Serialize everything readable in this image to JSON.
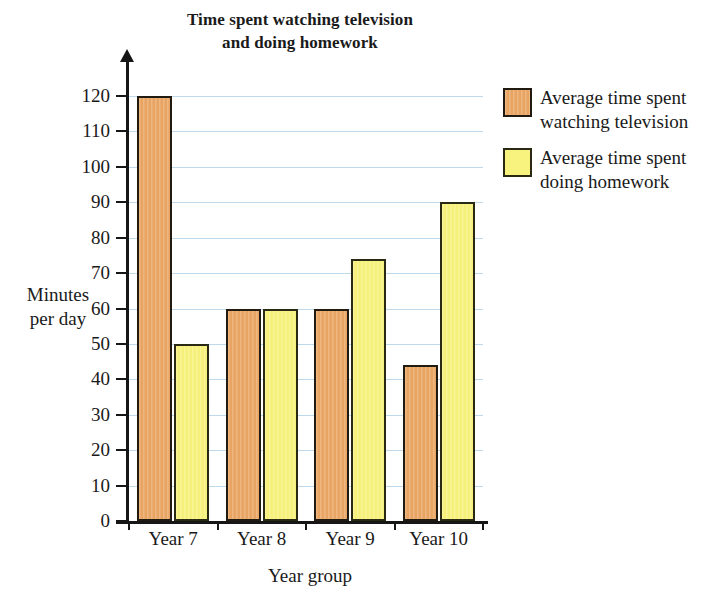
{
  "chart_data": {
    "type": "bar",
    "title": "Time spent watching television and doing homework",
    "title_lines": [
      "Time spent watching television",
      "and doing homework"
    ],
    "xlabel": "Year group",
    "ylabel": "Minutes per day",
    "ylabel_lines": [
      "Minutes",
      "per day"
    ],
    "categories": [
      "Year 7",
      "Year 8",
      "Year 9",
      "Year 10"
    ],
    "series": [
      {
        "name": "Average time spent watching television",
        "name_lines": [
          "Average time spent",
          "watching television"
        ],
        "color": "#eca968",
        "values": [
          120,
          60,
          60,
          44
        ]
      },
      {
        "name": "Average time spent doing homework",
        "name_lines": [
          "Average time spent",
          "doing homework"
        ],
        "color": "#f8f37e",
        "values": [
          50,
          60,
          74,
          90
        ]
      }
    ],
    "ylim": [
      0,
      120
    ],
    "ytick_step": 10,
    "yticks": [
      0,
      10,
      20,
      30,
      40,
      50,
      60,
      70,
      80,
      90,
      100,
      110,
      120
    ],
    "ytick_labels": [
      "0",
      "10",
      "20",
      "30",
      "40",
      "50",
      "60",
      "70",
      "80",
      "90",
      "100",
      "110",
      "120"
    ],
    "grid": true,
    "grid_color": "#bfd9ec",
    "legend_position": "right",
    "axis_color": "#161616",
    "background": "#ffffff"
  }
}
